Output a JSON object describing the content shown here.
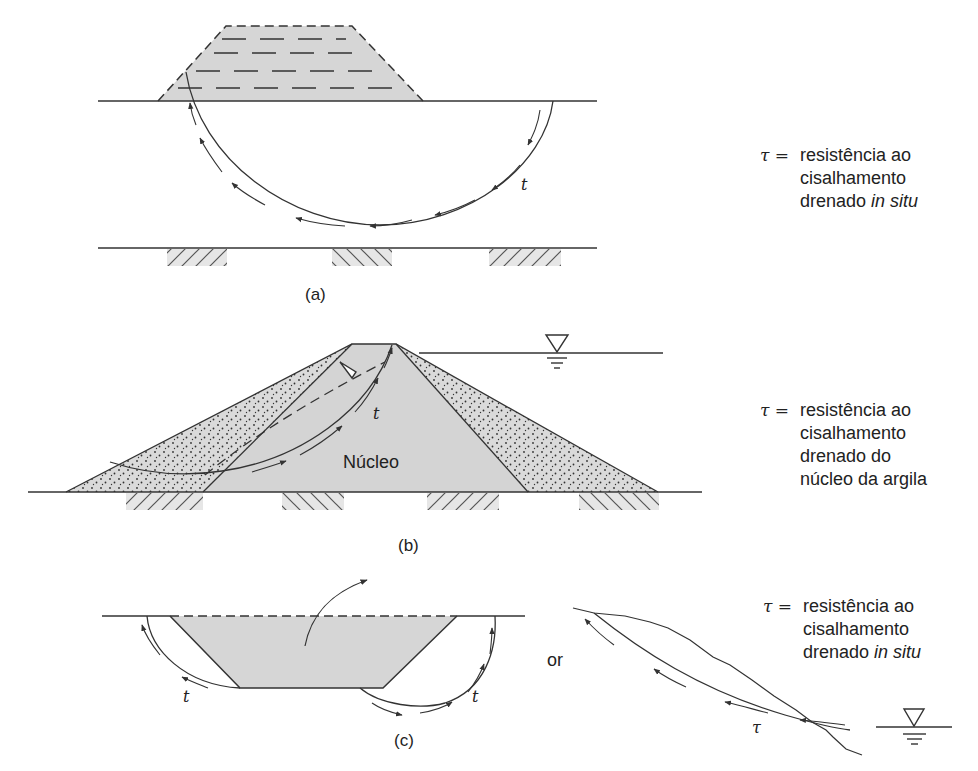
{
  "panels": {
    "a": {
      "caption": "(a)",
      "shear_symbol": "t",
      "legend": {
        "symbol": "τ =",
        "line1": "resistência ao",
        "line2": "cisalhamento",
        "line3_prefix": "drenado ",
        "line3_italic": "in situ"
      }
    },
    "b": {
      "caption": "(b)",
      "core_label": "Núcleo",
      "shear_symbol": "t",
      "legend": {
        "symbol": "τ =",
        "line1": "resistência ao",
        "line2": "cisalhamento",
        "line3": "drenado do",
        "line4": "núcleo da argila"
      }
    },
    "c": {
      "caption": "(c)",
      "shear_symbol_left": "t",
      "shear_symbol_right": "t",
      "or_label": "or",
      "slope_shear_symbol": "τ",
      "legend": {
        "symbol": "τ =",
        "line1": "resistência ao",
        "line2": "cisalhamento",
        "line3_prefix": "drenado ",
        "line3_italic": "in situ"
      }
    }
  },
  "colors": {
    "fill_gray": "#d6d6d6",
    "line": "#333333",
    "background": "#ffffff"
  }
}
